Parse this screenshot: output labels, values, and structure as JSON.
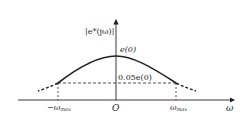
{
  "diagram": {
    "title": "",
    "y_axis_label": "|e*(jω)|",
    "x_axis_label": "ω",
    "origin_label": "O",
    "peak_label": "e(0)",
    "threshold_label": "0.05e(0)",
    "neg_cutoff_label": "−ωmax",
    "pos_cutoff_label": "ωmax",
    "neg_cutoff_main": "−ω",
    "pos_cutoff_main": "ω",
    "cutoff_sub": "max",
    "colors": {
      "stroke": "#222222",
      "background": "#ffffff"
    }
  }
}
